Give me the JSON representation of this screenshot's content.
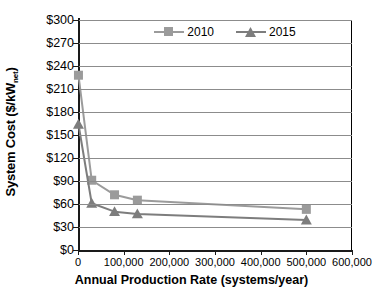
{
  "chart_data": {
    "type": "line",
    "title": "",
    "xlabel": "Annual Production Rate (systems/year)",
    "ylabel": "System Cost ($/kW",
    "ylabel_sub": "net",
    "ylabel_suffix": ")",
    "xlim": [
      0,
      600000
    ],
    "ylim": [
      0,
      300
    ],
    "grid": "horizontal",
    "legend_position": "top-center",
    "xticks": [
      0,
      100000,
      200000,
      300000,
      400000,
      500000,
      600000
    ],
    "xtick_labels": [
      "0",
      "100,000",
      "200,000",
      "300,000",
      "400,000",
      "500,000",
      "600,000"
    ],
    "yticks": [
      0,
      30,
      60,
      90,
      120,
      150,
      180,
      210,
      240,
      270,
      300
    ],
    "ytick_labels": [
      "$0",
      "$30",
      "$60",
      "$90",
      "$120",
      "$150",
      "$180",
      "$210",
      "$240",
      "$270",
      "$300"
    ],
    "series": [
      {
        "name": "2010",
        "marker": "square",
        "color": "#9b9b9b",
        "x": [
          1000,
          30000,
          80000,
          130000,
          500000
        ],
        "y": [
          228,
          91,
          72,
          65,
          53
        ]
      },
      {
        "name": "2015",
        "marker": "triangle",
        "color": "#7d7d7d",
        "x": [
          1000,
          30000,
          80000,
          130000,
          500000
        ],
        "y": [
          164,
          61,
          50,
          47,
          39
        ]
      }
    ]
  },
  "legend": {
    "items": [
      {
        "label": "2010"
      },
      {
        "label": "2015"
      }
    ]
  },
  "colors": {
    "series_2010": "#9b9b9b",
    "series_2015": "#7d7d7d",
    "gridline": "#8c8c8c",
    "axis": "#1a1a1a",
    "background": "#ffffff"
  }
}
